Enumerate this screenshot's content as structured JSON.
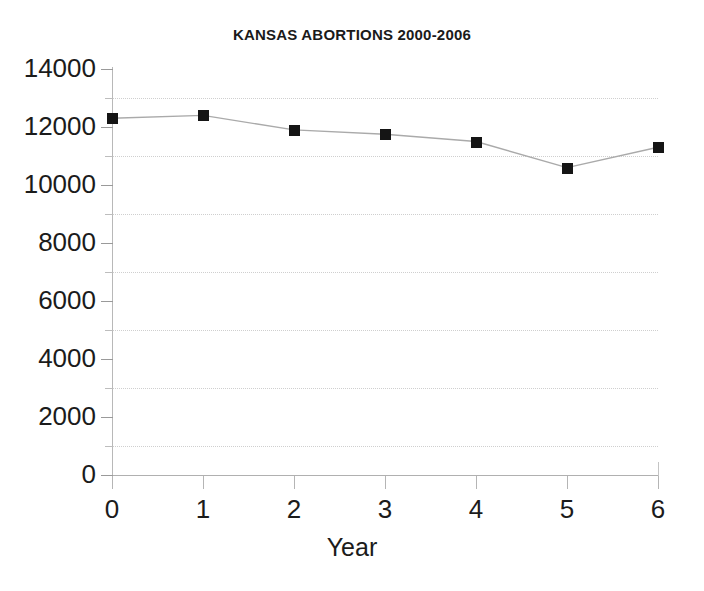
{
  "chart_data": {
    "type": "line",
    "title": "KANSAS ABORTIONS 2000-2006",
    "xlabel": "Year",
    "ylabel": "",
    "x": [
      0,
      1,
      2,
      3,
      4,
      5,
      6
    ],
    "values": [
      12300,
      12400,
      11900,
      11750,
      11500,
      10600,
      11300
    ],
    "series": [
      {
        "name": "Kansas abortions",
        "values": [
          12300,
          12400,
          11900,
          11750,
          11500,
          10600,
          11300
        ]
      }
    ],
    "xlim": [
      0,
      6
    ],
    "ylim": [
      0,
      14000
    ],
    "x_tick_labels": [
      "0",
      "1",
      "2",
      "3",
      "4",
      "5",
      "6"
    ],
    "y_tick_labels": [
      "14000",
      "12000",
      "10000",
      "8000",
      "6000",
      "4000",
      "2000",
      "0"
    ],
    "y_major_ticks": [
      14000,
      12000,
      10000,
      8000,
      6000,
      4000,
      2000,
      0
    ],
    "y_minor_ticks": [
      13000,
      11000,
      9000,
      7000,
      5000,
      3000,
      1000
    ],
    "gridlines": [
      13000,
      11000,
      9000,
      7000,
      5000,
      3000,
      1000
    ],
    "grid": "horizontal-dotted-minor",
    "legend": "none",
    "legend_position": "none",
    "marker": "filled-square",
    "marker_color": "#151515",
    "line_color": "#aaaaaa",
    "background_color": "#ffffff",
    "axis_color": "#b0b0b0",
    "grid_color": "#cfcfcf"
  }
}
